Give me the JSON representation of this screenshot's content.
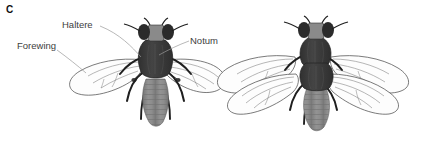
{
  "figure": {
    "panel_letter": "C",
    "background_color": "#ffffff"
  },
  "annotations": [
    {
      "id": "haltere",
      "label": "Haltere",
      "target": "left-fly-haltere"
    },
    {
      "id": "forewing",
      "label": "Forewing",
      "target": "left-fly-forewing"
    },
    {
      "id": "notum",
      "label": "Notum",
      "target": "left-fly-notum"
    }
  ],
  "specimens": [
    {
      "id": "wild-type",
      "position": "left",
      "wing_count": 2,
      "haltere_count": 2,
      "thorax_segments": 1,
      "leg_count": 6
    },
    {
      "id": "bithorax-mutant",
      "position": "right",
      "wing_count": 4,
      "haltere_count": 0,
      "thorax_segments": 2,
      "leg_count": 6
    }
  ],
  "palette": {
    "head_eye": "#2b2b2b",
    "head_face": "#8a8a8a",
    "thorax": "#3c3c3c",
    "thorax_shade": "#4a4a4a",
    "abdomen": "#8d8d8d",
    "abdomen_band": "#7c7c7c",
    "leg": "#1f1f1f",
    "wing_fill": "#fdfdfd",
    "wing_vein": "#6e6e6e",
    "wing_outline": "#4f4f4f",
    "leader_line": "#9a9a9a",
    "label_text": "#404040",
    "panel_text": "#111111"
  }
}
